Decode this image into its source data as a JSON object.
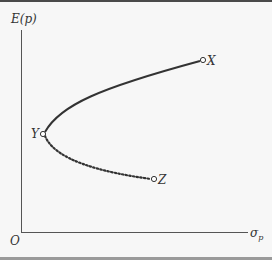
{
  "diagram": {
    "y_axis_label": "E(p)",
    "x_axis_label_main": "σ",
    "x_axis_label_sub": "p",
    "origin_label": "O",
    "points": [
      {
        "name": "X",
        "label": "X"
      },
      {
        "name": "Y",
        "label": "Y"
      },
      {
        "name": "Z",
        "label": "Z"
      }
    ],
    "segments": [
      {
        "from": "Y",
        "to": "X",
        "style": "solid"
      },
      {
        "from": "Y",
        "to": "Z",
        "style": "dotted"
      }
    ],
    "colors": {
      "line": "#333333",
      "axis": "#555555",
      "background": "#f7f7f7",
      "top_border": "#4a4a4a",
      "bottom_border": "#9a9a9a"
    }
  }
}
